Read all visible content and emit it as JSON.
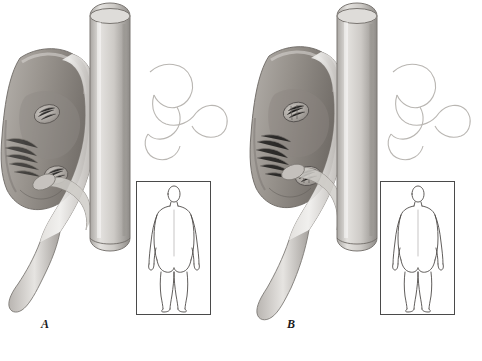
{
  "figure": {
    "type": "medical-illustration",
    "background_color": "#ffffff",
    "outline_color": "#4a4a4a"
  },
  "panels": [
    {
      "id": "A",
      "label": "A",
      "main_illustration": {
        "name": "kidney-sectioned-with-aorta",
        "structures": [
          "kidney",
          "renal-cortex",
          "renal-medulla-pyramid",
          "renal-vein",
          "renal-artery",
          "aorta",
          "ureter",
          "adrenal-gland-outline"
        ],
        "tones": {
          "kidney_body": "#9b9691",
          "kidney_shadow": "#6f6a66",
          "vessel_light": "#cfcbc6",
          "aorta": "#c8c5c1",
          "outline": "#4a4a4a"
        }
      },
      "inset": {
        "name": "body-diagram-posterior",
        "view": "posterior",
        "description": "Line drawing of a standing human figure seen from behind",
        "marker": "none"
      }
    },
    {
      "id": "B",
      "label": "B",
      "main_illustration": {
        "name": "kidney-sectioned-with-aorta-variant",
        "structures": [
          "kidney",
          "renal-cortex",
          "renal-medulla-pyramid",
          "renal-vein",
          "renal-artery",
          "aorta",
          "ureter",
          "adrenal-gland-outline"
        ],
        "tones": {
          "kidney_body": "#9b9691",
          "kidney_shadow": "#6f6a66",
          "vessel_light": "#cfcbc6",
          "aorta": "#c8c5c1",
          "outline": "#4a4a4a"
        }
      },
      "inset": {
        "name": "body-diagram-posterior",
        "view": "posterior",
        "description": "Line drawing of a standing human figure seen from behind",
        "marker": "none"
      }
    }
  ]
}
